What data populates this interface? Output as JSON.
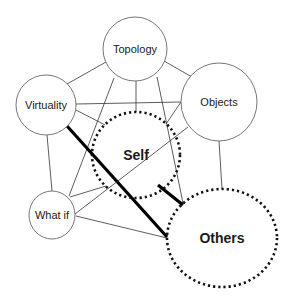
{
  "diagram": {
    "nodes": [
      {
        "id": "topology",
        "label": "Topology",
        "cx": 135,
        "cy": 49,
        "rx": 32,
        "ry": 32,
        "style": "solid",
        "bold": false,
        "font_size": 11
      },
      {
        "id": "virtuality",
        "label": "Virtuality",
        "cx": 46,
        "cy": 105,
        "rx": 30,
        "ry": 30,
        "style": "solid",
        "bold": false,
        "font_size": 11
      },
      {
        "id": "objects",
        "label": "Objects",
        "cx": 219,
        "cy": 102,
        "rx": 38,
        "ry": 39,
        "style": "solid",
        "bold": false,
        "font_size": 11
      },
      {
        "id": "whatif",
        "label": "What if",
        "cx": 52,
        "cy": 215,
        "rx": 23,
        "ry": 24,
        "style": "solid",
        "bold": false,
        "font_size": 11
      },
      {
        "id": "self",
        "label": "Self",
        "cx": 136,
        "cy": 155,
        "rx": 44,
        "ry": 43,
        "style": "dotted",
        "bold": true,
        "font_size": 14
      },
      {
        "id": "others",
        "label": "Others",
        "cx": 222,
        "cy": 238,
        "rx": 55,
        "ry": 49,
        "style": "dotted",
        "bold": true,
        "font_size": 14
      }
    ],
    "edges": [
      {
        "from": "topology",
        "to": "virtuality",
        "x1": 106,
        "y1": 62,
        "x2": 67,
        "y2": 84,
        "weight": "thin"
      },
      {
        "from": "topology",
        "to": "objects",
        "x1": 164,
        "y1": 61,
        "x2": 192,
        "y2": 77,
        "weight": "thin"
      },
      {
        "from": "topology",
        "to": "self",
        "x1": 136,
        "y1": 81,
        "x2": 136,
        "y2": 112,
        "weight": "thin"
      },
      {
        "from": "topology",
        "to": "whatif",
        "x1": 114,
        "y1": 78,
        "x2": 69,
        "y2": 196,
        "weight": "thin"
      },
      {
        "from": "topology",
        "to": "others",
        "x1": 157,
        "y1": 77,
        "x2": 183,
        "y2": 203,
        "weight": "thin"
      },
      {
        "from": "virtuality",
        "to": "objects",
        "x1": 76,
        "y1": 104,
        "x2": 181,
        "y2": 102,
        "weight": "thin"
      },
      {
        "from": "virtuality",
        "to": "self",
        "x1": 76,
        "y1": 110,
        "x2": 105,
        "y2": 125,
        "weight": "thin"
      },
      {
        "from": "virtuality",
        "to": "whatif",
        "x1": 47,
        "y1": 135,
        "x2": 52,
        "y2": 191,
        "weight": "thin"
      },
      {
        "from": "virtuality",
        "to": "others",
        "x1": 67,
        "y1": 126,
        "x2": 167,
        "y2": 237,
        "weight": "thick"
      },
      {
        "from": "objects",
        "to": "self",
        "x1": 181,
        "y1": 102,
        "x2": 166,
        "y2": 124,
        "weight": "thin"
      },
      {
        "from": "objects",
        "to": "whatif",
        "x1": 188,
        "y1": 127,
        "x2": 75,
        "y2": 214,
        "weight": "thin"
      },
      {
        "from": "objects",
        "to": "others",
        "x1": 219,
        "y1": 141,
        "x2": 222,
        "y2": 189,
        "weight": "thin"
      },
      {
        "from": "whatif",
        "to": "self",
        "x1": 70,
        "y1": 197,
        "x2": 106,
        "y2": 186,
        "weight": "thin"
      },
      {
        "from": "whatif",
        "to": "others",
        "x1": 76,
        "y1": 216,
        "x2": 167,
        "y2": 238,
        "weight": "thin"
      },
      {
        "from": "self",
        "to": "others",
        "x1": 158,
        "y1": 185,
        "x2": 183,
        "y2": 205,
        "weight": "thick"
      }
    ],
    "colors": {
      "stroke": "#333333",
      "thick": "#000000",
      "circle": "#666666",
      "dotted": "#111111",
      "background": "#ffffff"
    }
  }
}
